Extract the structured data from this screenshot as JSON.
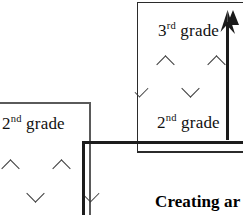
{
  "figure": {
    "caption_heading": "Creating ar",
    "cards": [
      {
        "id": "back-card",
        "grade_prefix": "3",
        "grade_ordinal": "rd",
        "grade_word": "grade",
        "secondary_prefix": "2",
        "secondary_ordinal": "nd",
        "secondary_word": "grade",
        "marks": [
          "up",
          "up",
          "down",
          "partial-up"
        ]
      },
      {
        "id": "front-card",
        "grade_prefix": "2",
        "grade_ordinal": "nd",
        "grade_word": "grade",
        "marks": [
          "up",
          "up",
          "down"
        ]
      }
    ],
    "arrow": {
      "direction": "up",
      "name": "upward-arrow"
    },
    "colors": {
      "ink": "#111111",
      "rule_heavy": "#1c1c1c",
      "rule_light": "#4b4b4b",
      "mark": "#3a3a3a",
      "page": "#ffffff"
    }
  }
}
